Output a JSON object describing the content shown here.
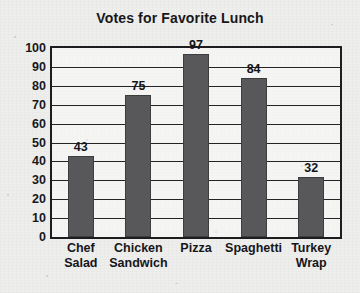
{
  "chart_data": {
    "type": "bar",
    "title": "Votes for Favorite Lunch",
    "xlabel": "",
    "ylabel": "",
    "categories": [
      "Chef Salad",
      "Chicken Sandwich",
      "Pizza",
      "Spaghetti",
      "Turkey Wrap"
    ],
    "category_lines": [
      [
        "Chef",
        "Salad"
      ],
      [
        "Chicken",
        "Sandwich"
      ],
      [
        "Pizza"
      ],
      [
        "Spaghetti"
      ],
      [
        "Turkey",
        "Wrap"
      ]
    ],
    "values": [
      43,
      75,
      97,
      84,
      32
    ],
    "value_labels": [
      "43",
      "75",
      "97",
      "84",
      "32"
    ],
    "ylim": [
      0,
      100
    ],
    "ytick_step": 10,
    "yticks": [
      "100",
      "90",
      "80",
      "70",
      "60",
      "50",
      "40",
      "30",
      "20",
      "10",
      "0"
    ],
    "grid": true,
    "legend": "none",
    "colors": {
      "bar_fill": "#58585a",
      "axis_line": "#1d1d1f",
      "gridline": "#242426",
      "text": "#16161a",
      "paper": "#eeeeec"
    }
  }
}
